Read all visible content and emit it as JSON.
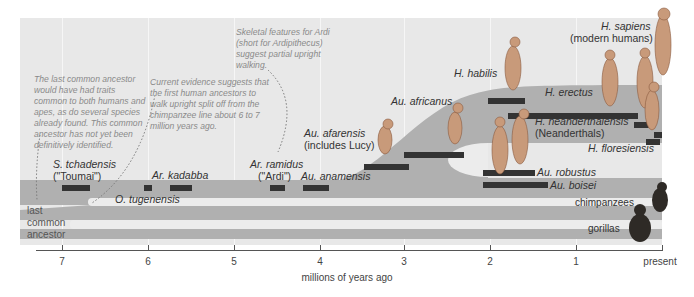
{
  "diagram": {
    "type": "hominin phylogeny timeline",
    "axis": {
      "title": "millions of years ago",
      "ticks": [
        "7",
        "6",
        "5",
        "4",
        "3",
        "2",
        "1",
        "present"
      ]
    },
    "notes": {
      "common_ancestor": "The last common ancestor would have had traits common to both humans and apes, as do several species already found. This common ancestor has not yet been definitively identified.",
      "upright_split": "Current evidence suggests that the first human ancestors to walk upright split off from the chimpanzee line about 6 to 7 million years ago.",
      "ardi": "Skeletal features for Ardi (short for Ardipithecus) suggest partial upright walking."
    },
    "species": {
      "tchadensis_1": "S. tchadensis",
      "tchadensis_2": "(\"Toumai\")",
      "kadabba": "Ar. kadabba",
      "tugenensis": "O. tugenensis",
      "ramidus_1": "Ar. ramidus",
      "ramidus_2": "(\"Ardi\")",
      "anamensis": "Au. anamensis",
      "afarensis_1": "Au. afarensis",
      "afarensis_2": "(includes Lucy)",
      "africanus": "Au. africanus",
      "habilis": "H. habilis",
      "erectus": "H. erectus",
      "neanderthalensis_1": "H. neanderthalensis",
      "neanderthalensis_2": "(Neanderthals)",
      "floresiensis": "H. floresiensis",
      "robustus": "Au. robustus",
      "boisei": "Au. boisei",
      "sapiens_1": "H. sapiens",
      "sapiens_2": "(modern humans)"
    },
    "lineages": {
      "chimpanzees": "chimpanzees",
      "gorillas": "gorillas",
      "ancestor_1": "last",
      "ancestor_2": "common",
      "ancestor_3": "ancestor"
    },
    "colors": {
      "background": "#e8e8e8",
      "band": "#b0b0b0",
      "bar": "#333333",
      "note_text": "#8a8a8a"
    }
  }
}
